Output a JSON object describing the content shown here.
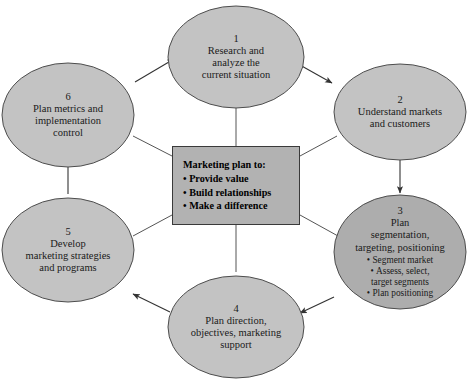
{
  "diagram": {
    "colors": {
      "ellipse_fill": "#c3c3c3",
      "ellipse_fill_highlight": "#adadad",
      "ellipse_stroke": "#4d4d4d",
      "center_box_fill": "#b2b2b2",
      "center_box_stroke": "#3a3a3a",
      "text": "#1a1a1a",
      "arrow": "#333333",
      "background": "#ffffff"
    },
    "center_box": {
      "title": "Marketing plan to:",
      "bullets": [
        "Provide value",
        "Build relationships",
        "Make a difference"
      ]
    },
    "steps": [
      {
        "number": "1",
        "label": "Research and\nanalyze the\ncurrent situation",
        "bullets": []
      },
      {
        "number": "2",
        "label": "Understand markets\nand customers",
        "bullets": []
      },
      {
        "number": "3",
        "label": "Plan\nsegmentation,\ntargeting, positioning",
        "bullets": [
          "Segment market",
          "Assess, select,\ntarget segments",
          "Plan positioning"
        ]
      },
      {
        "number": "4",
        "label": "Plan direction,\nobjectives, marketing\nsupport",
        "bullets": []
      },
      {
        "number": "5",
        "label": "Develop\nmarketing strategies\nand programs",
        "bullets": []
      },
      {
        "number": "6",
        "label": "Plan metrics and\nimplementation\ncontrol",
        "bullets": []
      }
    ]
  }
}
